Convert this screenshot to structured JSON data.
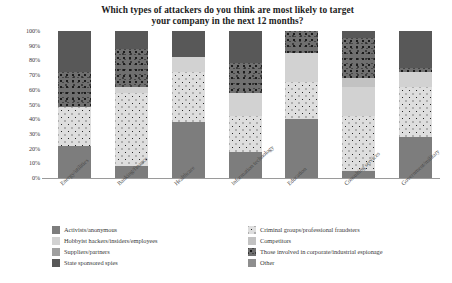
{
  "chart_data": {
    "type": "bar",
    "subtype": "stacked-percentage-column",
    "title": "Which types of attackers do you think are most likely to target your company in the next 12 months?",
    "title_line1": "Which types of attackers do you think are most likely to target",
    "title_line2": "your company in the next 12 months?",
    "xlabel": "",
    "ylabel": "",
    "ylim": [
      0,
      100
    ],
    "yticks": [
      "0%",
      "10%",
      "20%",
      "30%",
      "40%",
      "50%",
      "60%",
      "70%",
      "80%",
      "90%",
      "100%"
    ],
    "ytick_values": [
      0,
      10,
      20,
      30,
      40,
      50,
      60,
      70,
      80,
      90,
      100
    ],
    "grid": false,
    "legend_position": "bottom",
    "categories": [
      "Energy/utilities",
      "Banking/finance",
      "Healthcare",
      "Information technology",
      "Education",
      "Consulting services",
      "Government/military"
    ],
    "series": [
      {
        "name": "Activists/anonymous",
        "fill": "f-activists",
        "color": "#7d7d7d",
        "values": [
          22,
          8,
          38,
          18,
          40,
          5,
          28
        ]
      },
      {
        "name": "Criminal groups/professional fraudsters",
        "fill": "f-criminal",
        "color": "#dedede",
        "values": [
          26,
          50,
          34,
          24,
          25,
          37,
          34
        ]
      },
      {
        "name": "Hobbyist hackers/insiders/employees",
        "fill": "f-hobbyist",
        "color": "#d2d2d2",
        "values": [
          0,
          4,
          10,
          16,
          20,
          20,
          10
        ]
      },
      {
        "name": "Competitors",
        "fill": "f-competitors",
        "color": "#c2c2c2",
        "values": [
          0,
          0,
          0,
          0,
          0,
          6,
          0
        ]
      },
      {
        "name": "Suppliers/partners",
        "fill": "f-suppliers",
        "color": "#a0a0a0",
        "values": [
          0,
          0,
          0,
          0,
          0,
          0,
          0
        ]
      },
      {
        "name": "Those involved in corporate/industrial espionage",
        "fill": "f-espionage",
        "color": "#6f6f6f",
        "values": [
          24,
          26,
          0,
          20,
          15,
          27,
          3
        ]
      },
      {
        "name": "State sponsored spies",
        "fill": "f-spies",
        "color": "#585858",
        "values": [
          28,
          12,
          18,
          22,
          0,
          5,
          25
        ]
      },
      {
        "name": "Other",
        "fill": "f-other",
        "color": "#8e8e8e",
        "values": [
          0,
          0,
          0,
          0,
          0,
          0,
          0
        ]
      }
    ],
    "legend_left": [
      "Activists/anonymous",
      "Hobbyist hackers/insiders/employees",
      "Suppliers/partners",
      "State sponsored spies"
    ],
    "legend_right": [
      "Criminal groups/professional fraudsters",
      "Competitors",
      "Those involved in corporate/industrial espionage",
      "Other"
    ],
    "legend_left_fills": [
      "f-activists",
      "f-hobbyist",
      "f-suppliers",
      "f-spies"
    ],
    "legend_right_fills": [
      "f-criminal",
      "f-competitors",
      "f-espionage",
      "f-other"
    ]
  }
}
